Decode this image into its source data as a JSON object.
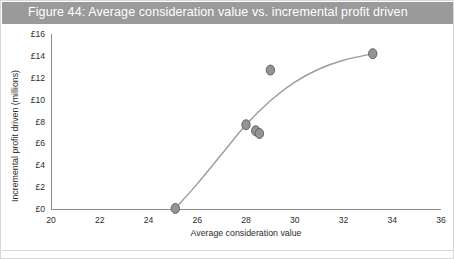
{
  "figure": {
    "title": "Figure 44: Average consideration value vs. incremental profit driven",
    "title_bar_color": "#9a9a9a",
    "title_text_color": "#ffffff",
    "background_color": "#ffffff",
    "border_color": "#d8d8d8"
  },
  "chart_data": {
    "type": "scatter",
    "title": "Figure 44: Average consideration value vs. incremental profit driven",
    "xlabel": "Average consideration value",
    "ylabel": "Incremental profit driven (millions)",
    "xlim": [
      20,
      36
    ],
    "ylim": [
      0,
      16
    ],
    "xticks": [
      20,
      22,
      24,
      26,
      28,
      30,
      32,
      34,
      36
    ],
    "xtick_labels": [
      "20",
      "22",
      "24",
      "26",
      "28",
      "30",
      "32",
      "34",
      "36"
    ],
    "yticks": [
      0,
      2,
      4,
      6,
      8,
      10,
      12,
      14,
      16
    ],
    "ytick_labels": [
      "£0",
      "£2",
      "£4",
      "£6",
      "£8",
      "£10",
      "£12",
      "£14",
      "£16"
    ],
    "grid": false,
    "legend": null,
    "marker_color": "#939393",
    "marker_edge_color": "#5a5a5a",
    "curve_color": "#9c9c9c",
    "points": [
      {
        "x": 25.1,
        "y": 0.05
      },
      {
        "x": 28.0,
        "y": 7.7
      },
      {
        "x": 28.4,
        "y": 7.15
      },
      {
        "x": 28.55,
        "y": 6.9
      },
      {
        "x": 29.0,
        "y": 12.7
      },
      {
        "x": 33.2,
        "y": 14.2
      }
    ],
    "trend_curve": [
      {
        "x": 25.1,
        "y": 0.05
      },
      {
        "x": 26.0,
        "y": 2.3
      },
      {
        "x": 27.0,
        "y": 5.0
      },
      {
        "x": 28.0,
        "y": 7.7
      },
      {
        "x": 29.0,
        "y": 9.9
      },
      {
        "x": 30.0,
        "y": 11.6
      },
      {
        "x": 31.0,
        "y": 12.8
      },
      {
        "x": 32.0,
        "y": 13.6
      },
      {
        "x": 33.2,
        "y": 14.2
      }
    ]
  }
}
